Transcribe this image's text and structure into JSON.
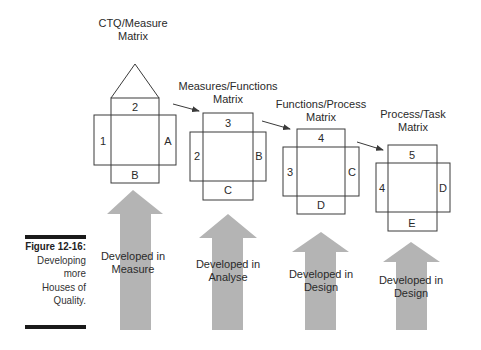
{
  "caption": {
    "figure_label": "Figure 12-16:",
    "lines": [
      "Developing",
      "more",
      "Houses of",
      "Quality."
    ]
  },
  "colors": {
    "line": "#3a3a3a",
    "arrow_fill": "#b4b4b4",
    "caption_bar": "#1a1a1a",
    "text": "#333333"
  },
  "houses": [
    {
      "title_lines": [
        "CTQ/Measure",
        "Matrix"
      ],
      "top": "2",
      "left": "1",
      "right": "A",
      "bottom": "B",
      "has_roof": true,
      "phase_lines": [
        "Developed in",
        "Measure"
      ]
    },
    {
      "title_lines": [
        "Measures/Functions",
        "Matrix"
      ],
      "top": "3",
      "left": "2",
      "right": "B",
      "bottom": "C",
      "has_roof": false,
      "phase_lines": [
        "Developed in",
        "Analyse"
      ]
    },
    {
      "title_lines": [
        "Functions/Process",
        "Matrix"
      ],
      "top": "4",
      "left": "3",
      "right": "C",
      "bottom": "D",
      "has_roof": false,
      "phase_lines": [
        "Developed in",
        "Design"
      ]
    },
    {
      "title_lines": [
        "Process/Task",
        "Matrix"
      ],
      "top": "5",
      "left": "4",
      "right": "D",
      "bottom": "E",
      "has_roof": false,
      "phase_lines": [
        "Developed in",
        "Design"
      ]
    }
  ]
}
